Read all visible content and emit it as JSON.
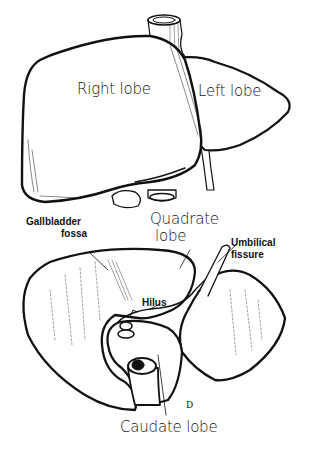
{
  "figure": {
    "top_view": {
      "labels": {
        "right_lobe": "Right lobe",
        "left_lobe": "Left lobe"
      }
    },
    "bottom_view": {
      "labels": {
        "gallbladder_fossa_line1": "Gallbladder",
        "gallbladder_fossa_line2": "fossa",
        "quadrate_lobe_line1": "Quadrate",
        "quadrate_lobe_line2": "lobe",
        "umbilical_fissure_line1": "Umbilical",
        "umbilical_fissure_line2": "fissure",
        "hilus": "Hilus",
        "caudate_lobe": "Caudate lobe"
      }
    },
    "signature": "D",
    "colors": {
      "ink": "#111111",
      "background": "#ffffff"
    }
  }
}
